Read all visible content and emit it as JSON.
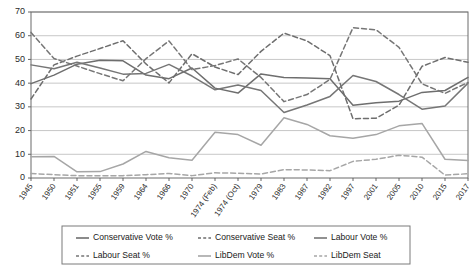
{
  "chart_data": {
    "type": "line",
    "title": "",
    "xlabel": "",
    "ylabel": "",
    "ylim": [
      0,
      70
    ],
    "ytick_values": [
      0,
      10,
      20,
      30,
      40,
      50,
      60,
      70
    ],
    "grid": true,
    "legend_position": "bottom",
    "categories": [
      "1945",
      "1950",
      "1951",
      "1955",
      "1959",
      "1964",
      "1966",
      "1970",
      "1974 (Feb)",
      "1974 (Oct)",
      "1979",
      "1983",
      "1987",
      "1992",
      "1997",
      "2001",
      "2005",
      "2010",
      "2015",
      "2017"
    ],
    "series": [
      {
        "name": "Conservative Vote %",
        "style": "solid",
        "color": "#6e6e6e",
        "values": [
          39.8,
          43.4,
          48.0,
          49.7,
          49.4,
          43.4,
          41.9,
          46.4,
          37.9,
          35.8,
          43.9,
          42.4,
          42.2,
          41.9,
          30.7,
          31.7,
          32.4,
          36.1,
          36.9,
          42.4
        ]
      },
      {
        "name": "Conservative Seat %",
        "style": "dashed",
        "color": "#6e6e6e",
        "values": [
          33.3,
          47.7,
          51.4,
          54.6,
          57.9,
          48.1,
          40.1,
          52.4,
          46.8,
          43.6,
          53.4,
          61.1,
          57.8,
          51.6,
          25.0,
          25.2,
          30.7,
          47.1,
          50.8,
          48.8
        ]
      },
      {
        "name": "Labour Vote %",
        "style": "solid",
        "color": "#767676",
        "values": [
          47.7,
          46.1,
          48.8,
          46.4,
          43.8,
          44.1,
          47.9,
          43.0,
          37.2,
          39.2,
          36.9,
          27.6,
          30.8,
          34.4,
          43.2,
          40.7,
          35.2,
          29.0,
          30.4,
          40.0
        ]
      },
      {
        "name": "Labour Seat %",
        "style": "dashed",
        "color": "#767676",
        "values": [
          61.4,
          50.4,
          47.2,
          44.0,
          41.0,
          50.3,
          57.8,
          45.7,
          47.4,
          50.2,
          42.4,
          32.2,
          35.2,
          41.6,
          63.4,
          62.5,
          55.1,
          39.7,
          35.7,
          40.3
        ]
      },
      {
        "name": "LibDem Vote %",
        "style": "solid",
        "color": "#a6a6a6",
        "values": [
          9.0,
          9.1,
          2.6,
          2.7,
          5.9,
          11.2,
          8.5,
          7.5,
          19.3,
          18.3,
          13.8,
          25.4,
          22.6,
          17.8,
          16.8,
          18.3,
          22.0,
          23.0,
          7.9,
          7.4
        ]
      },
      {
        "name": "LibDem Seat",
        "style": "dashed",
        "color": "#a6a6a6",
        "values": [
          1.9,
          1.4,
          1.0,
          1.0,
          1.0,
          1.4,
          1.9,
          1.0,
          2.2,
          2.0,
          1.7,
          3.5,
          3.4,
          3.1,
          7.0,
          7.9,
          9.6,
          8.8,
          1.2,
          1.8
        ]
      }
    ]
  },
  "legend": {
    "entries": [
      {
        "label": "Conservative Vote %"
      },
      {
        "label": "Conservative Seat %"
      },
      {
        "label": "Labour Vote %"
      },
      {
        "label": "Labour Seat %"
      },
      {
        "label": "LibDem Vote %"
      },
      {
        "label": "LibDem Seat"
      }
    ]
  }
}
